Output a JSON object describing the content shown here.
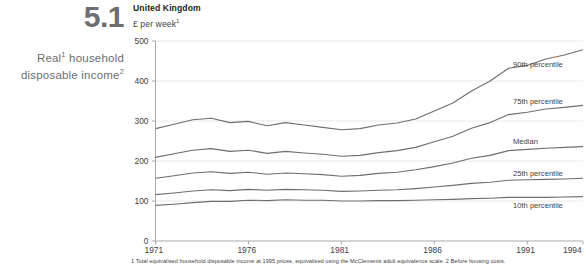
{
  "figure": {
    "number": "5.1",
    "row_title_line1": "Real",
    "row_title_sup1": "1",
    "row_title_line1b": " household",
    "row_title_line2": "disposable income",
    "row_title_sup2": "2",
    "country": "United Kingdom",
    "units": "£ per week",
    "units_sup": "1",
    "footnote": "1 Total equivalised household disposable income at 1995 prices, equivalised using the McClements adult equivalence scale.  2 Before housing costs."
  },
  "chart_data": {
    "type": "line",
    "title": "United Kingdom",
    "subtitle": "£ per week",
    "xlabel": "",
    "ylabel": "£ per week",
    "xlim": [
      1971,
      1994
    ],
    "ylim": [
      0,
      500
    ],
    "yticks": [
      0,
      100,
      200,
      300,
      400,
      500
    ],
    "xticks": [
      1971,
      1976,
      1981,
      1986,
      1991,
      1994
    ],
    "grid": "horizontal",
    "legend_position": "right-inline",
    "line_color": "#6d6e71",
    "x": [
      1971,
      1972,
      1973,
      1974,
      1975,
      1976,
      1977,
      1978,
      1979,
      1980,
      1981,
      1982,
      1983,
      1984,
      1985,
      1986,
      1987,
      1988,
      1989,
      1990,
      1991,
      1992,
      1993,
      1994
    ],
    "series": [
      {
        "name": "90th percentile",
        "values": [
          281,
          292,
          303,
          307,
          296,
          299,
          288,
          296,
          290,
          284,
          278,
          281,
          290,
          295,
          305,
          325,
          345,
          375,
          400,
          432,
          439,
          455,
          465,
          478
        ]
      },
      {
        "name": "75th percentile",
        "values": [
          209,
          218,
          227,
          231,
          224,
          227,
          219,
          224,
          220,
          217,
          212,
          214,
          221,
          226,
          234,
          248,
          262,
          282,
          296,
          316,
          322,
          330,
          334,
          339
        ]
      },
      {
        "name": "Median",
        "values": [
          157,
          163,
          170,
          173,
          169,
          172,
          167,
          170,
          168,
          166,
          162,
          164,
          169,
          172,
          178,
          186,
          195,
          207,
          214,
          226,
          229,
          232,
          234,
          236
        ]
      },
      {
        "name": "25th percentile",
        "values": [
          116,
          120,
          125,
          128,
          126,
          129,
          127,
          129,
          128,
          127,
          124,
          125,
          127,
          128,
          131,
          135,
          139,
          144,
          147,
          152,
          153,
          154,
          155,
          157
        ]
      },
      {
        "name": "10th percentile",
        "values": [
          89,
          92,
          96,
          99,
          99,
          102,
          101,
          103,
          102,
          102,
          100,
          100,
          101,
          101,
          102,
          103,
          104,
          106,
          107,
          109,
          109,
          109,
          110,
          111
        ]
      }
    ],
    "series_label_y": [
      {
        "name": "90th percentile",
        "label_value": 440
      },
      {
        "name": "75th percentile",
        "label_value": 348
      },
      {
        "name": "Median",
        "label_value": 248
      },
      {
        "name": "25th percentile",
        "label_value": 168
      },
      {
        "name": "10th percentile",
        "label_value": 88
      }
    ]
  }
}
